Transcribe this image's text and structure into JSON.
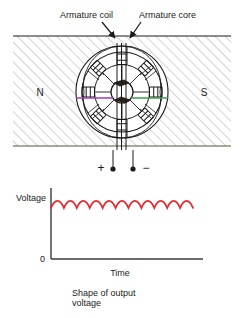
{
  "figure": {
    "title_labels": {
      "armature_coil": "Armature coil",
      "armature_core": "Armature core"
    },
    "poles": {
      "north": "N",
      "south": "S"
    },
    "terminals": {
      "positive": "+",
      "negative": "−"
    },
    "caption": {
      "line1": "Shape of output",
      "line2": "voltage"
    },
    "colors": {
      "stroke": "#1a1a1a",
      "hatch": "#9a9a9a",
      "coil_left": "#a23cb0",
      "coil_right": "#3f9c48",
      "waveform": "#e02b32",
      "axis": "#3a3a3a",
      "background": "#ffffff"
    },
    "geometry": {
      "machine_center_x": 122,
      "machine_center_y": 92,
      "outer_radius": 46,
      "stator_inner_radius": 40,
      "coil_ring_radius": 27,
      "shaft_radius": 11,
      "pole_field_top": 36,
      "pole_field_bottom": 146,
      "pole_field_left": 13,
      "pole_field_right": 231,
      "slot_count": 8
    }
  },
  "chart_data": {
    "type": "line",
    "title": "Shape of output voltage",
    "xlabel": "Time",
    "ylabel": "Voltage",
    "ytick_labels": [
      "0"
    ],
    "xlim": [
      0,
      1
    ],
    "ylim": [
      0,
      1
    ],
    "grid": false,
    "legend": null,
    "ripple_count": 11,
    "ripple_min": 0.72,
    "ripple_max": 0.82,
    "series": [
      {
        "name": "Output voltage",
        "color": "#e02b32",
        "description": "Rectified commutated DC with small ripple: a sequence of 11 half-sine humps riding on a nearly constant level",
        "x": [
          0.0,
          0.05,
          0.09,
          0.14,
          0.18,
          0.23,
          0.27,
          0.32,
          0.36,
          0.41,
          0.45,
          0.5,
          0.55,
          0.59,
          0.64,
          0.68,
          0.73,
          0.77,
          0.82,
          0.86,
          0.91,
          0.95,
          1.0
        ],
        "y": [
          0.72,
          0.82,
          0.72,
          0.82,
          0.72,
          0.82,
          0.72,
          0.82,
          0.72,
          0.82,
          0.72,
          0.82,
          0.72,
          0.82,
          0.72,
          0.82,
          0.72,
          0.82,
          0.72,
          0.82,
          0.72,
          0.82,
          0.72
        ]
      }
    ]
  }
}
